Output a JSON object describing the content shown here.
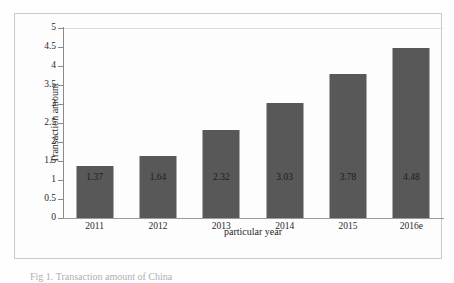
{
  "chart_data": {
    "type": "bar",
    "title": "",
    "xlabel": "particular year",
    "ylabel": "Transaction amount",
    "categories": [
      "2011",
      "2012",
      "2013",
      "2014",
      "2015",
      "2016e"
    ],
    "values": [
      1.37,
      1.64,
      2.32,
      3.03,
      3.78,
      4.48
    ],
    "data_labels": [
      "1.37",
      "1.64",
      "2.32",
      "3.03",
      "3.78",
      "4.48"
    ],
    "ylim": [
      0,
      5
    ],
    "ytick_labels": [
      "0",
      "0.5",
      "1",
      "1.5",
      "2",
      "2.5",
      "3",
      "3.5",
      "4",
      "4.5",
      "5"
    ],
    "ytick_values": [
      0,
      0.5,
      1,
      1.5,
      2,
      2.5,
      3,
      3.5,
      4,
      4.5,
      5
    ],
    "grid": "top-line-only",
    "legend": "none",
    "bar_color": "#585858",
    "plot_background": "#fdfdfd",
    "frame_color": "#c9c9c9"
  },
  "caption": {
    "text": "Fig 1. Transaction amount of China"
  }
}
